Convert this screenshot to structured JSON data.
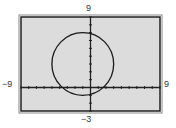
{
  "window": {
    "xmin_label": "−9",
    "xmax_label": "9",
    "ymax_label": "9",
    "ymin_label": "−3"
  },
  "colors": {
    "screen_bg": "#dcdcdc",
    "frame": "#222222",
    "curve": "#1a1a1a"
  },
  "chart_data": {
    "type": "line",
    "title": "",
    "xlabel": "",
    "ylabel": "",
    "xlim": [
      -9,
      9
    ],
    "ylim": [
      -3,
      9
    ],
    "xscale": 1,
    "yscale": 1,
    "grid": false,
    "axes": true,
    "tick_marks": true,
    "series": [
      {
        "name": "circle",
        "shape": "circle",
        "center": [
          -1,
          3
        ],
        "radius": 4
      }
    ],
    "tick_labels": {
      "x_left": "−9",
      "x_right": "9",
      "y_top": "9",
      "y_bottom": "−3"
    }
  }
}
